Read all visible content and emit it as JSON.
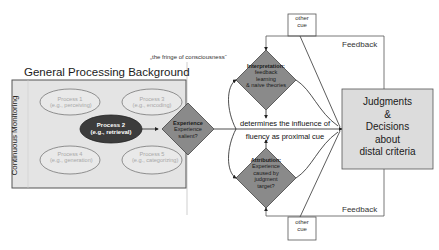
{
  "background": {
    "title": "General Processing Background",
    "side_label": "Continuous Monitoring"
  },
  "processes": [
    {
      "name": "Process 1",
      "example": "(e.g., perceiving)",
      "highlighted": false
    },
    {
      "name": "Process 2",
      "example": "(e.g., retrieval)",
      "highlighted": true
    },
    {
      "name": "Process 3",
      "example": "(e.g., encoding)",
      "highlighted": false
    },
    {
      "name": "Process 4",
      "example": "(e.g., generation)",
      "highlighted": false
    },
    {
      "name": "Process 5",
      "example": "(e.g., categorizing)",
      "highlighted": false
    }
  ],
  "fringe_label": "„the fringe of consciousness“",
  "experience_diamond": {
    "title": "Experience",
    "line1": "Experience",
    "line2": "salient?"
  },
  "interpretation_diamond": {
    "title": "Interpretation:",
    "line1": "feedback",
    "line2": "learning",
    "line3": "& naive theories"
  },
  "attribution_diamond": {
    "title": "Attribution:",
    "line1": "Experience",
    "line2": "caused by",
    "line3": "judgment",
    "line4": "target?"
  },
  "central_statement": {
    "line1": "determines the influence of",
    "line2": "fluency as proximal cue"
  },
  "other_cue_top": {
    "line1": "other",
    "line2": "cue"
  },
  "other_cue_bottom": {
    "line1": "other",
    "line2": "cue"
  },
  "feedback_top": "Feedback",
  "feedback_bottom": "Feedback",
  "outcome": {
    "line1": "Judgments",
    "line2": "&",
    "line3": "Decisions",
    "line4": "about",
    "line5": "distal criteria"
  },
  "colors": {
    "background_box": "#e4e4e4",
    "diamond_fill": "#8a8a8a",
    "highlight_ellipse": "#3c3c3c",
    "outcome_box": "#dcdcdc",
    "line": "#333333"
  }
}
